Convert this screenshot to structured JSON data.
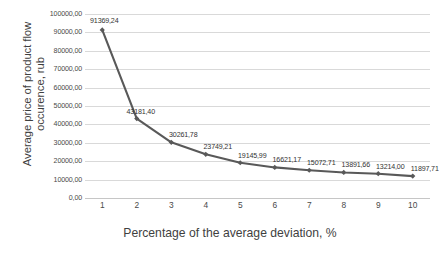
{
  "chart_data": {
    "type": "line",
    "title": "",
    "xlabel": "Percentage of the average deviation, %",
    "ylabel": "Average price of product flow occurence, rub",
    "ylabel_lines": [
      "Average price of product flow",
      "occurence, rub"
    ],
    "categories": [
      "1",
      "2",
      "3",
      "4",
      "5",
      "6",
      "7",
      "8",
      "9",
      "10"
    ],
    "x": [
      1,
      2,
      3,
      4,
      5,
      6,
      7,
      8,
      9,
      10
    ],
    "values": [
      91369.24,
      43181.4,
      30261.78,
      23749.21,
      19145.99,
      16621.17,
      15072.71,
      13891.66,
      13214.0,
      11897.71
    ],
    "data_labels": [
      "91369,24",
      "43181,40",
      "30261,78",
      "23749,21",
      "19145,99",
      "16621,17",
      "15072,71",
      "13891,66",
      "13214,00",
      "11897,71"
    ],
    "ylim": [
      0,
      100000
    ],
    "ytick_values": [
      0,
      10000,
      20000,
      30000,
      40000,
      50000,
      60000,
      70000,
      80000,
      90000,
      100000
    ],
    "ytick_labels": [
      "0,00",
      "10000,00",
      "20000,00",
      "30000,00",
      "40000,00",
      "50000,00",
      "60000,00",
      "70000,00",
      "80000,00",
      "90000,00",
      "100000,00"
    ],
    "xlim": [
      0.5,
      10.5
    ],
    "grid": "horizontal",
    "legend": "none",
    "series_color": "#595959",
    "marker": "diamond",
    "gridline_color": "#D9D9D9"
  }
}
